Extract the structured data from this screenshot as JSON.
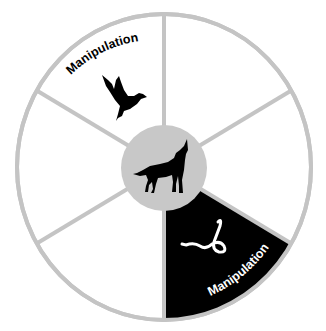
{
  "diagram": {
    "type": "wheel",
    "segment_count": 6,
    "colors": {
      "ring": "#c4c4c4",
      "hub": "#c8c8c8",
      "highlight_segment": "#000000",
      "background_segment": "#ffffff",
      "icon_dark": "#000000",
      "icon_light": "#ffffff"
    },
    "hub": {
      "icon": "howling-wolf-icon"
    },
    "segments": [
      {
        "position": "top-left",
        "label": "Manipulation",
        "icon": "dove-icon",
        "highlighted": false
      },
      {
        "position": "top-right",
        "label": "",
        "icon": "",
        "highlighted": false
      },
      {
        "position": "right",
        "label": "",
        "icon": "",
        "highlighted": false
      },
      {
        "position": "bottom-right",
        "label": "Manipulation",
        "icon": "snake-icon",
        "highlighted": true
      },
      {
        "position": "bottom-left",
        "label": "",
        "icon": "",
        "highlighted": false
      },
      {
        "position": "left",
        "label": "",
        "icon": "",
        "highlighted": false
      }
    ]
  }
}
